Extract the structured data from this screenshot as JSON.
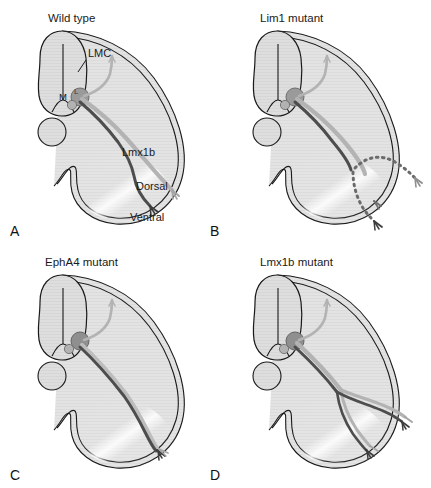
{
  "figure": {
    "background_color": "#ffffff",
    "outline_color": "#1a1a1a",
    "tissue_fill": "#dcdcdc",
    "limb_fill": "#e6e6e6",
    "dorsal_nerve_color": "#a8a8a8",
    "ventral_nerve_color": "#4a4a4a",
    "soma_color": "#8c8c8c"
  },
  "panels": [
    {
      "id": "A",
      "letter": "A",
      "title": "Wild type",
      "annotations": [
        {
          "key": "lmc",
          "label": "LMC"
        },
        {
          "key": "medial",
          "label": "M"
        },
        {
          "key": "lateral",
          "label": "L"
        },
        {
          "key": "lmx1b",
          "label": "Lmx1b"
        },
        {
          "key": "dorsal",
          "label": "Dorsal"
        },
        {
          "key": "ventral",
          "label": "Ventral"
        }
      ],
      "nerve_pattern": "bifurcated-dorsal-and-ventral",
      "dorsal_branch": true,
      "ventral_branch": true,
      "dashed_paths": false
    },
    {
      "id": "B",
      "letter": "B",
      "title": "Lim1 mutant",
      "annotations": [],
      "nerve_pattern": "randomized-dashed",
      "dorsal_branch": true,
      "ventral_branch": true,
      "dashed_paths": true
    },
    {
      "id": "C",
      "letter": "C",
      "title": "EphA4 mutant",
      "annotations": [],
      "nerve_pattern": "all-ventral",
      "dorsal_branch": false,
      "ventral_branch": true,
      "dashed_paths": false
    },
    {
      "id": "D",
      "letter": "D",
      "title": "Lmx1b mutant",
      "annotations": [],
      "nerve_pattern": "both-split-dorsal-and-ventral",
      "dorsal_branch": true,
      "ventral_branch": true,
      "dashed_paths": false
    }
  ]
}
